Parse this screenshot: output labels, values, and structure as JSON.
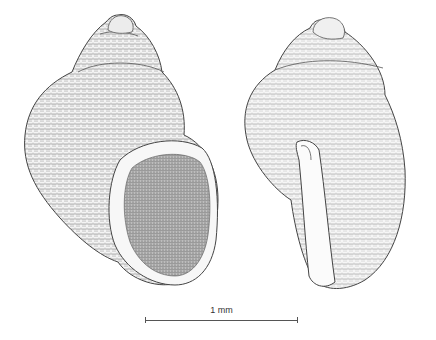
{
  "figure": {
    "views": [
      {
        "name": "apertural view",
        "position": "left"
      },
      {
        "name": "lateral view",
        "position": "right"
      }
    ],
    "scale_bar": {
      "label": "1 mm"
    },
    "colors": {
      "ink": "#3a3a3a",
      "paper": "#ffffff",
      "shade": "#8a8a8a"
    }
  }
}
